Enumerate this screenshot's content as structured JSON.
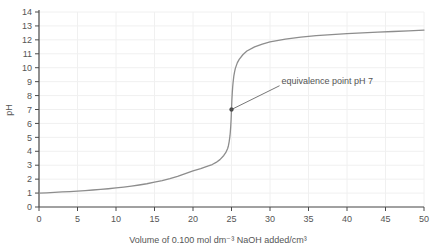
{
  "chart_data": {
    "type": "line",
    "title": "",
    "xlabel": "Volume of 0.100 mol dm⁻³ NaOH added/cm³",
    "ylabel": "pH",
    "xlim": [
      0,
      50
    ],
    "ylim": [
      0,
      14
    ],
    "grid": true,
    "legend_position": "none",
    "xticks": [
      0,
      5,
      10,
      15,
      20,
      25,
      30,
      35,
      40,
      45,
      50
    ],
    "xtick_labels": [
      "0",
      "5",
      "10",
      "15",
      "20",
      "25",
      "30",
      "35",
      "40",
      "45",
      "50"
    ],
    "yticks": [
      0,
      1,
      2,
      3,
      4,
      5,
      6,
      7,
      8,
      9,
      10,
      11,
      12,
      13,
      14
    ],
    "ytick_labels": [
      "0",
      "1",
      "2",
      "3",
      "4",
      "5",
      "6",
      "7",
      "8",
      "9",
      "10",
      "11",
      "12",
      "13",
      "14"
    ],
    "series": [
      {
        "name": "titration curve",
        "color": "#8d8d8d",
        "x": [
          0,
          1,
          2,
          3,
          4,
          5,
          6,
          7,
          8,
          9,
          10,
          11,
          12,
          13,
          14,
          15,
          16,
          17,
          18,
          19,
          20,
          21,
          22,
          22.5,
          23,
          23.5,
          24,
          24.25,
          24.5,
          24.6,
          24.7,
          24.8,
          24.85,
          24.9,
          24.95,
          25,
          25.05,
          25.1,
          25.15,
          25.2,
          25.3,
          25.4,
          25.5,
          25.75,
          26,
          26.5,
          27,
          28,
          29,
          30,
          32,
          34,
          36,
          38,
          40,
          42,
          44,
          46,
          48,
          50
        ],
        "y": [
          1.0,
          1.02,
          1.05,
          1.08,
          1.11,
          1.14,
          1.18,
          1.22,
          1.26,
          1.31,
          1.37,
          1.43,
          1.5,
          1.58,
          1.67,
          1.78,
          1.9,
          2.04,
          2.2,
          2.4,
          2.6,
          2.75,
          2.95,
          3.05,
          3.2,
          3.4,
          3.7,
          3.9,
          4.2,
          4.4,
          4.7,
          5.1,
          5.4,
          5.8,
          6.3,
          7.0,
          7.7,
          8.2,
          8.6,
          8.9,
          9.4,
          9.7,
          9.95,
          10.35,
          10.6,
          10.95,
          11.2,
          11.5,
          11.7,
          11.85,
          12.05,
          12.2,
          12.3,
          12.38,
          12.45,
          12.5,
          12.55,
          12.6,
          12.65,
          12.7
        ]
      }
    ],
    "annotations": [
      {
        "text": "equivalence point pH 7",
        "point_x": 25,
        "point_y": 7,
        "label_x": 31.5,
        "label_y": 8.85,
        "marker": true
      }
    ]
  }
}
